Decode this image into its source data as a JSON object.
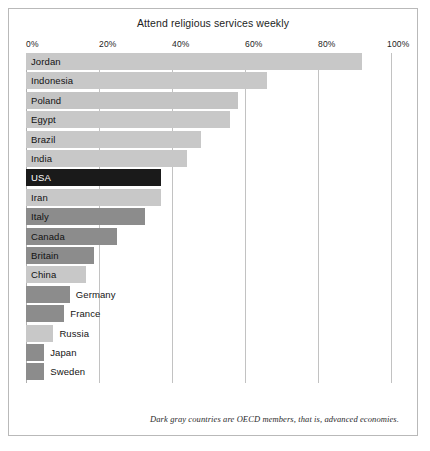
{
  "chart_data": {
    "type": "bar",
    "orientation": "horizontal",
    "title": "Attend religious services weekly",
    "xlabel": "",
    "ylabel": "",
    "xlim": [
      0,
      100
    ],
    "grid": true,
    "legend": null,
    "tick_labels": [
      "0%",
      "20%",
      "40%",
      "60%",
      "80%",
      "100%"
    ],
    "tick_values": [
      0,
      20,
      40,
      60,
      80,
      100
    ],
    "categories": [
      "Jordan",
      "Indonesia",
      "Poland",
      "Egypt",
      "Brazil",
      "India",
      "USA",
      "Iran",
      "Italy",
      "Canada",
      "Britain",
      "China",
      "Germany",
      "France",
      "Russia",
      "Japan",
      "Sweden"
    ],
    "values": [
      92,
      66,
      58,
      56,
      48,
      44,
      37,
      37,
      32.5,
      25,
      18.5,
      16.5,
      12,
      10.5,
      7.5,
      5,
      5
    ],
    "oecd_member": [
      false,
      false,
      true,
      false,
      false,
      false,
      true,
      false,
      true,
      true,
      true,
      false,
      true,
      true,
      false,
      true,
      true
    ],
    "bars": [
      {
        "label": "Jordan",
        "value": 92,
        "group": "non-oecd",
        "color": "#c8c8c8",
        "label_position": "inside"
      },
      {
        "label": "Indonesia",
        "value": 66,
        "group": "non-oecd",
        "color": "#c8c8c8",
        "label_position": "inside"
      },
      {
        "label": "Poland",
        "value": 58,
        "group": "oecd-light",
        "color": "#c4c4c4",
        "label_position": "inside"
      },
      {
        "label": "Egypt",
        "value": 56,
        "group": "non-oecd",
        "color": "#c8c8c8",
        "label_position": "inside"
      },
      {
        "label": "Brazil",
        "value": 48,
        "group": "non-oecd",
        "color": "#c8c8c8",
        "label_position": "inside"
      },
      {
        "label": "India",
        "value": 44,
        "group": "non-oecd",
        "color": "#c8c8c8",
        "label_position": "inside"
      },
      {
        "label": "USA",
        "value": 37,
        "group": "oecd-dark",
        "color": "#1a1a1a",
        "label_position": "inside"
      },
      {
        "label": "Iran",
        "value": 37,
        "group": "non-oecd",
        "color": "#c8c8c8",
        "label_position": "inside"
      },
      {
        "label": "Italy",
        "value": 32.5,
        "group": "oecd-dark",
        "color": "#8c8c8c",
        "label_position": "inside"
      },
      {
        "label": "Canada",
        "value": 25,
        "group": "oecd-dark",
        "color": "#8c8c8c",
        "label_position": "inside"
      },
      {
        "label": "Britain",
        "value": 18.5,
        "group": "oecd-dark",
        "color": "#8c8c8c",
        "label_position": "inside"
      },
      {
        "label": "China",
        "value": 16.5,
        "group": "non-oecd",
        "color": "#c8c8c8",
        "label_position": "inside"
      },
      {
        "label": "Germany",
        "value": 12,
        "group": "oecd-dark",
        "color": "#8c8c8c",
        "label_position": "outside"
      },
      {
        "label": "France",
        "value": 10.5,
        "group": "oecd-dark",
        "color": "#8c8c8c",
        "label_position": "outside"
      },
      {
        "label": "Russia",
        "value": 7.5,
        "group": "non-oecd",
        "color": "#c8c8c8",
        "label_position": "outside"
      },
      {
        "label": "Japan",
        "value": 5,
        "group": "oecd-dark",
        "color": "#8c8c8c",
        "label_position": "outside"
      },
      {
        "label": "Sweden",
        "value": 5,
        "group": "oecd-dark",
        "color": "#8c8c8c",
        "label_position": "outside"
      }
    ],
    "footnote": "Dark gray countries are OECD members, that is, advanced economies.",
    "colors": {
      "oecd_dark": "#8c8c8c",
      "highlight_dark": "#1a1a1a",
      "non_oecd_light": "#c8c8c8",
      "gridline": "#c2c2c2",
      "frame": "#b9b9b9",
      "text": "#141414",
      "background": "#ffffff"
    }
  }
}
